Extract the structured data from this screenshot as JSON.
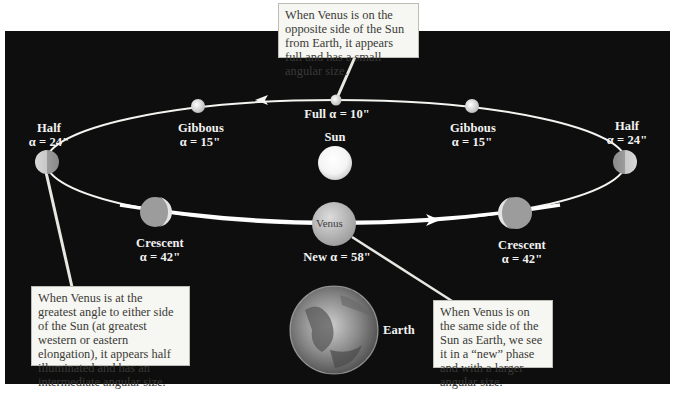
{
  "diagram": {
    "center_body": {
      "label": "Sun"
    },
    "observer": {
      "label": "Earth"
    },
    "orbit_direction": "counterclockwise (arrows along orbit)",
    "positions": [
      {
        "id": "half-left",
        "phase": "Half",
        "alpha": "α = 24\""
      },
      {
        "id": "gibbous-left",
        "phase": "Gibbous",
        "alpha": "α = 15\""
      },
      {
        "id": "full",
        "phase": "Full",
        "alpha": "α = 10\"",
        "inline_label": "Full α = 10\""
      },
      {
        "id": "gibbous-right",
        "phase": "Gibbous",
        "alpha": "α = 15\""
      },
      {
        "id": "half-right",
        "phase": "Half",
        "alpha": "α = 24\""
      },
      {
        "id": "crescent-left",
        "phase": "Crescent",
        "alpha": "α = 42\""
      },
      {
        "id": "new",
        "phase": "New",
        "alpha": "α = 58\"",
        "inline_label": "New α = 58\"",
        "planet_text": "Venus"
      },
      {
        "id": "crescent-right",
        "phase": "Crescent",
        "alpha": "α = 42\""
      }
    ],
    "callouts": {
      "top": "When Venus is on the opposite side of the Sun from Earth, it appears full and has a small angular size.",
      "left": "When Venus is at the greatest angle to either side of the Sun (at greatest western or eastern elongation), it appears half illuminated and has an intermediate angular size.",
      "right": "When Venus is on the same side of the Sun as Earth, we see it in a “new” phase and with a larger angular size."
    },
    "colors": {
      "background": "#0e0e0e",
      "orbit": "#f4f4f0",
      "callout_bg": "#f6f6f2",
      "label_text": "#f2f2f2"
    }
  }
}
